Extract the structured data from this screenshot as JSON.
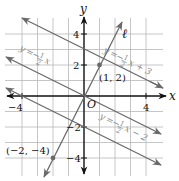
{
  "axes": {
    "x_label": "x",
    "y_label": "y",
    "origin_label": "O",
    "x_ticks": [
      {
        "value": -4,
        "label": "−4"
      },
      {
        "value": 4,
        "label": "4"
      }
    ],
    "y_ticks": [
      {
        "value": 4,
        "label": "4"
      },
      {
        "value": 2,
        "label": "2"
      },
      {
        "value": -2,
        "label": "−2"
      },
      {
        "value": -4,
        "label": "−4"
      }
    ],
    "grid_range": {
      "x": [
        -5,
        5
      ],
      "y": [
        -5,
        5
      ]
    }
  },
  "lines": [
    {
      "name": "line-top",
      "equation": "y = −½x + 3",
      "label_y": "y",
      "label_eq": "=",
      "label_minus": "−",
      "label_num": "1",
      "label_den": "2",
      "label_rest": "x + 3",
      "slope": -0.5,
      "intercept": 3
    },
    {
      "name": "line-middle",
      "equation": "y = −½x",
      "label_y": "y",
      "label_eq": "=",
      "label_minus": "−",
      "label_num": "1",
      "label_den": "2",
      "label_rest": "x",
      "slope": -0.5,
      "intercept": 0
    },
    {
      "name": "line-bottom",
      "equation": "y = −½x − 2",
      "label_y": "y",
      "label_eq": "=",
      "label_minus": "−",
      "label_num": "1",
      "label_den": "2",
      "label_rest": "x − 2",
      "slope": -0.5,
      "intercept": -2
    },
    {
      "name": "line-l",
      "label": "ℓ",
      "slope": 2,
      "intercept": 0
    }
  ],
  "points": [
    {
      "label": "(1, 2)",
      "x": 1,
      "y": 2
    },
    {
      "label": "(−2, −4)",
      "x": -2,
      "y": -4
    }
  ],
  "colors": {
    "grid": "#b0b0b0",
    "axis": "#111111",
    "lines": "#6a6a6a",
    "labels": "#8a8a8a",
    "point": "#6a6a6a"
  }
}
